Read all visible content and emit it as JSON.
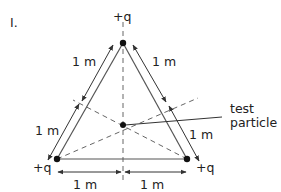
{
  "diagram": {
    "panel_label": "I.",
    "charges": {
      "top": "+q",
      "bottom_left": "+q",
      "bottom_right": "+q"
    },
    "distances": {
      "left_side": "1 m",
      "right_side": "1 m",
      "lower_left_side": "1 m",
      "lower_right_side": "1 m",
      "bottom_left_half": "1 m",
      "bottom_right_half": "1 m"
    },
    "test_particle": {
      "line1": "test",
      "line2": "particle"
    },
    "colors": {
      "line": "#333333",
      "point": "#111111"
    }
  }
}
